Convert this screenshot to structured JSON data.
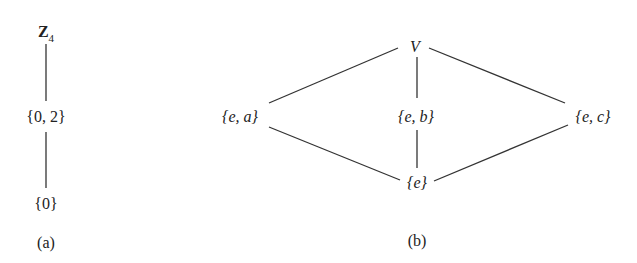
{
  "diagram_a": {
    "caption": "(a)",
    "nodes": [
      {
        "id": "Z4",
        "label": "Z",
        "subscript": "4",
        "x": 46,
        "y": 34
      },
      {
        "id": "02",
        "label": "{0, 2}",
        "x": 46,
        "y": 117
      },
      {
        "id": "0",
        "label": "{0}",
        "x": 46,
        "y": 204
      }
    ],
    "edges": [
      [
        "Z4",
        "02"
      ],
      [
        "02",
        "0"
      ]
    ]
  },
  "diagram_b": {
    "caption": "(b)",
    "nodes": [
      {
        "id": "V",
        "label": "V",
        "x": 415,
        "y": 47
      },
      {
        "id": "ea",
        "label": "{e, a}",
        "x": 240,
        "y": 117
      },
      {
        "id": "eb",
        "label": "{e, b}",
        "x": 416,
        "y": 117
      },
      {
        "id": "ec",
        "label": "{e, c}",
        "x": 593,
        "y": 117
      },
      {
        "id": "e",
        "label": "{e}",
        "x": 417,
        "y": 183
      }
    ],
    "edges": [
      [
        "V",
        "ea"
      ],
      [
        "V",
        "eb"
      ],
      [
        "V",
        "ec"
      ],
      [
        "ea",
        "e"
      ],
      [
        "eb",
        "e"
      ],
      [
        "ec",
        "e"
      ]
    ]
  }
}
